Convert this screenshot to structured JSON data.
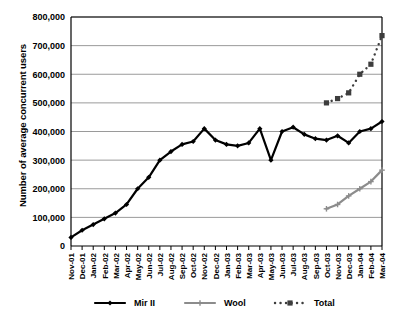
{
  "chart_data": {
    "type": "line",
    "title": "",
    "xlabel": "",
    "ylabel": "Number of average concurrent users",
    "ylim": [
      0,
      800000
    ],
    "ytick_labels": [
      "0",
      "100,000",
      "200,000",
      "300,000",
      "400,000",
      "500,000",
      "600,000",
      "700,000",
      "800,000"
    ],
    "ytick_values": [
      0,
      100000,
      200000,
      300000,
      400000,
      500000,
      600000,
      700000,
      800000
    ],
    "grid": "horizontal",
    "legend_position": "bottom",
    "categories": [
      "Nov-01",
      "Dec-01",
      "Jan-02",
      "Feb-02",
      "Mar-02",
      "Apr-02",
      "May-02",
      "Jun-02",
      "Jul-02",
      "Aug-02",
      "Sep-02",
      "Oct-02",
      "Nov-02",
      "Dec-02",
      "Jan-03",
      "Feb-03",
      "Mar-03",
      "Apr-03",
      "May-03",
      "Jun-03",
      "Jul-03",
      "Aug-03",
      "Sep-03",
      "Oct-03",
      "Nov-03",
      "Dec-03",
      "Jan-04",
      "Feb-04",
      "Mar-04"
    ],
    "series": [
      {
        "name": "Mir II",
        "color": "#000000",
        "style": "solid",
        "marker": "diamond",
        "values": [
          30000,
          55000,
          75000,
          95000,
          115000,
          145000,
          200000,
          240000,
          300000,
          330000,
          355000,
          365000,
          410000,
          370000,
          355000,
          350000,
          360000,
          410000,
          300000,
          400000,
          415000,
          390000,
          375000,
          370000,
          385000,
          360000,
          400000,
          410000,
          435000
        ]
      },
      {
        "name": "Wool",
        "color": "#8c8c8c",
        "style": "solid",
        "marker": "plus",
        "values": [
          null,
          null,
          null,
          null,
          null,
          null,
          null,
          null,
          null,
          null,
          null,
          null,
          null,
          null,
          null,
          null,
          null,
          null,
          null,
          null,
          null,
          null,
          null,
          130000,
          145000,
          175000,
          200000,
          225000,
          265000
        ]
      },
      {
        "name": "Total",
        "color": "#3d3d3d",
        "style": "dotted",
        "marker": "square",
        "values": [
          null,
          null,
          null,
          null,
          null,
          null,
          null,
          null,
          null,
          null,
          null,
          null,
          null,
          null,
          null,
          null,
          null,
          null,
          null,
          null,
          null,
          null,
          null,
          500000,
          515000,
          535000,
          600000,
          635000,
          735000
        ]
      }
    ]
  },
  "legend": {
    "items": [
      {
        "label": "Mir II"
      },
      {
        "label": "Wool"
      },
      {
        "label": "Total"
      }
    ]
  }
}
